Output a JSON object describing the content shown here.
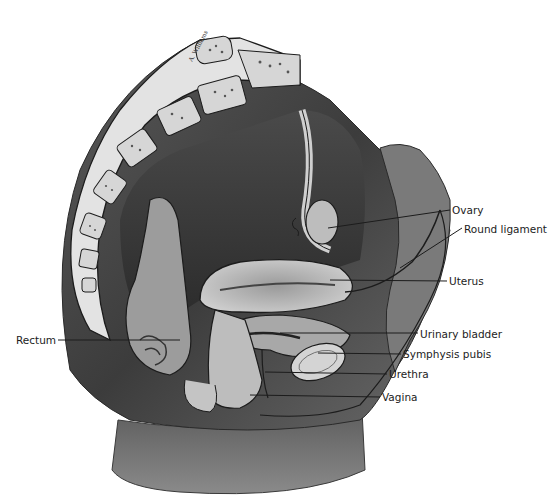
{
  "figure": {
    "type": "anatomical-illustration",
    "view": "midsagittal section, female pelvis",
    "artist_signature": "A. Williams",
    "palette": {
      "background": "#ffffff",
      "ink": "#1c1c1c",
      "dark_tissue": "#3a3a3a",
      "mid_tissue": "#6e6e6e",
      "light_tissue": "#c9c9c9",
      "bone": "#e6e6e6"
    }
  },
  "labels": [
    {
      "id": "ovary",
      "text": "Ovary",
      "x": 452,
      "y": 213
    },
    {
      "id": "round-ligament",
      "text": "Round ligament",
      "x": 464,
      "y": 225
    },
    {
      "id": "uterus",
      "text": "Uterus",
      "x": 449,
      "y": 277
    },
    {
      "id": "urinary-bladder",
      "text": "Urinary bladder",
      "x": 420,
      "y": 330
    },
    {
      "id": "symphysis-pubis",
      "text": "Symphysis pubis",
      "x": 403,
      "y": 350
    },
    {
      "id": "urethra",
      "text": "Urethra",
      "x": 389,
      "y": 370
    },
    {
      "id": "vagina",
      "text": "Vagina",
      "x": 382,
      "y": 393
    },
    {
      "id": "rectum",
      "text": "Rectum",
      "x": 16,
      "y": 334
    }
  ]
}
